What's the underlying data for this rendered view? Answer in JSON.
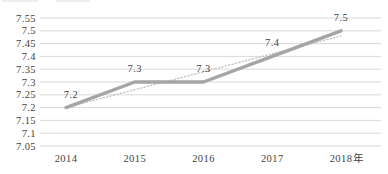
{
  "chart_data": {
    "type": "line",
    "title": "",
    "categories": [
      "2014",
      "2015",
      "2016",
      "2017",
      "2018"
    ],
    "x_axis_unit_suffix": "年",
    "series": [
      {
        "name": "series-values",
        "values": [
          7.2,
          7.3,
          7.3,
          7.4,
          7.5
        ],
        "data_labels": [
          "7.2",
          "7.3",
          "7.3",
          "7.4",
          "7.5"
        ],
        "style": "solid",
        "color": "#a5a5a5"
      },
      {
        "name": "linear-trendline",
        "values": [
          7.2,
          7.27,
          7.34,
          7.41,
          7.48
        ],
        "data_labels": [],
        "style": "dotted",
        "color": "#c3c3c3"
      }
    ],
    "y_axis": {
      "min": 7.05,
      "max": 7.55,
      "step": 0.05,
      "tick_labels": [
        "7.55",
        "7.5",
        "7.45",
        "7.4",
        "7.35",
        "7.3",
        "7.25",
        "7.2",
        "7.15",
        "7.1",
        "7.05"
      ]
    },
    "xlabel": "",
    "ylabel": "",
    "grid": true,
    "legend": "none",
    "colors": {
      "gridline": "#d9d9d9",
      "axis_text": "#3f3f3f",
      "data_label_text": "#3f3f3f"
    }
  }
}
